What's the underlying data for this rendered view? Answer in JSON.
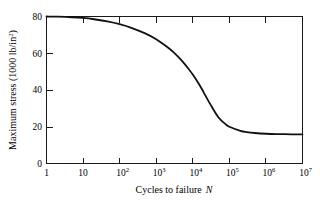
{
  "chart_data": {
    "type": "line",
    "title": "",
    "xlabel": "Cycles to failure N",
    "xlabel_main": "Cycles to failure",
    "xlabel_symbol": "N",
    "ylabel": "Maximum stress (1000 lb/in2)",
    "ylabel_prefix": "Maximum stress (1000 lb/in",
    "ylabel_sup": "2",
    "ylabel_suffix": ")",
    "xscale": "log",
    "xlim": [
      1,
      10000000
    ],
    "ylim": [
      0,
      80
    ],
    "grid": false,
    "legend": false,
    "xticks": [
      1,
      10,
      100,
      1000,
      10000,
      100000,
      1000000,
      10000000
    ],
    "xtick_labels": [
      {
        "base": "1",
        "exp": ""
      },
      {
        "base": "10",
        "exp": ""
      },
      {
        "base": "10",
        "exp": "2"
      },
      {
        "base": "10",
        "exp": "3"
      },
      {
        "base": "10",
        "exp": "4"
      },
      {
        "base": "10",
        "exp": "5"
      },
      {
        "base": "10",
        "exp": "6"
      },
      {
        "base": "10",
        "exp": "7"
      }
    ],
    "yticks": [
      0,
      20,
      40,
      60,
      80
    ],
    "ytick_labels": [
      "0",
      "20",
      "40",
      "60",
      "80"
    ],
    "series": [
      {
        "name": "S-N fatigue curve",
        "color": "#111111",
        "x": [
          1,
          2,
          5,
          10,
          20,
          50,
          100,
          200,
          500,
          1000,
          2000,
          3000,
          5000,
          8000,
          10000,
          15000,
          20000,
          30000,
          50000,
          80000,
          100000,
          200000,
          300000,
          500000,
          1000000,
          2000000,
          5000000,
          10000000
        ],
        "y": [
          80.0,
          79.9,
          79.6,
          79.2,
          78.5,
          77.2,
          75.8,
          74.0,
          70.8,
          67.6,
          63.4,
          60.5,
          56.0,
          51.0,
          48.4,
          43.0,
          38.6,
          32.3,
          25.2,
          21.3,
          20.0,
          17.8,
          17.1,
          16.6,
          16.2,
          16.0,
          15.9,
          15.8
        ]
      }
    ],
    "colors": {
      "curve": "#111111",
      "axis": "#1a1a1a",
      "background": "#ffffff",
      "text": "#000000"
    }
  }
}
